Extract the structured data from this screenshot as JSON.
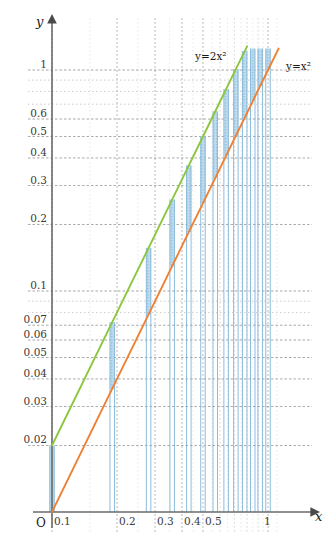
{
  "chart_data": {
    "type": "line",
    "title": "",
    "xlabel": "x",
    "ylabel": "y",
    "scale": "log-log",
    "grid": true,
    "legend_position": "inline-annotations",
    "xlim": [
      0.1,
      1.15
    ],
    "ylim": [
      0.01,
      1.25
    ],
    "x_tick_labels": [
      "0.1",
      "0.2",
      "0.3",
      "0.4",
      "0.5",
      "1"
    ],
    "x_tick_values": [
      0.1,
      0.2,
      0.3,
      0.4,
      0.5,
      1
    ],
    "x_minor_values": [
      0.6,
      0.7,
      0.8,
      0.9
    ],
    "y_tick_labels": [
      "0.02",
      "0.03",
      "0.04",
      "0.05",
      "0.06",
      "0.07",
      "0.1",
      "0.2",
      "0.3",
      "0.4",
      "0.5",
      "0.6",
      "1"
    ],
    "y_tick_values": [
      0.02,
      0.03,
      0.04,
      0.05,
      0.06,
      0.07,
      0.1,
      0.2,
      0.3,
      0.4,
      0.5,
      0.6,
      1
    ],
    "y_minor_values": [
      0.08,
      0.09,
      0.7,
      0.8,
      0.9
    ],
    "origin_label": "O",
    "series": [
      {
        "name": "y=2x^2",
        "label": "y=2x²",
        "color": "#8cc63f",
        "formula_coefficient": 2,
        "exponent": 2,
        "x": [
          0.1,
          0.2,
          0.3,
          0.4,
          0.5,
          0.6,
          0.7,
          0.8
        ],
        "y": [
          0.02,
          0.08,
          0.18,
          0.32,
          0.5,
          0.72,
          0.98,
          1.28
        ]
      },
      {
        "name": "y=x^2",
        "label": "y=x²",
        "color": "#ef8033",
        "formula_coefficient": 1,
        "exponent": 2,
        "x": [
          0.1,
          0.2,
          0.3,
          0.4,
          0.5,
          0.6,
          0.7,
          0.8,
          0.9,
          1.0,
          1.12
        ],
        "y": [
          0.01,
          0.04,
          0.09,
          0.16,
          0.25,
          0.36,
          0.49,
          0.64,
          0.81,
          1.0,
          1.25
        ]
      }
    ],
    "vertical_bars": {
      "color": "#a8cfe6",
      "description": "Vertical shaded bars spanning from y=x^2 up to y=2x^2 at selected x values",
      "x_values": [
        0.1,
        0.19,
        0.28,
        0.36,
        0.43,
        0.5,
        0.57,
        0.64,
        0.71,
        0.78,
        0.85,
        0.92,
        1.0
      ]
    }
  },
  "annotations": {
    "green_curve_label": "y=2x²",
    "orange_curve_label": "y=x²"
  },
  "colors": {
    "green": "#8cc63f",
    "orange": "#ef8033",
    "bar_blue": "#a8cfe6",
    "axis": "#5a5a5a",
    "grid": "#b8b8b8",
    "text": "#1a1a1a"
  }
}
